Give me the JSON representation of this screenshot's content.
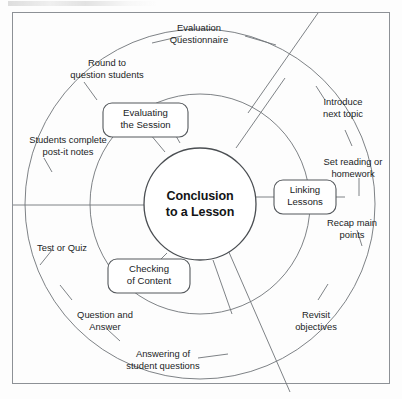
{
  "figure": {
    "hub": {
      "line1": "Conclusion",
      "line2": "to a Lesson"
    },
    "nodes": [
      {
        "id": "evaluating-the-session",
        "line1": "Evaluating",
        "line2": "the Session"
      },
      {
        "id": "linking-lessons",
        "line1": "Linking",
        "line2": "Lessons"
      },
      {
        "id": "checking-of-content",
        "line1": "Checking",
        "line2": "of Content"
      }
    ],
    "outer_labels": [
      {
        "id": "evaluation-questionnaire",
        "line1": "Evaluation",
        "line2": "Questionnaire"
      },
      {
        "id": "round-to-question-students",
        "line1": "Round to",
        "line2": "question students"
      },
      {
        "id": "students-complete-post-it",
        "line1": "Students complete",
        "line2": "post-it notes"
      },
      {
        "id": "test-or-quiz",
        "line1": "Test or Quiz",
        "line2": ""
      },
      {
        "id": "question-and-answer",
        "line1": "Question and",
        "line2": "Answer"
      },
      {
        "id": "answering-of-student-questions",
        "line1": "Answering of",
        "line2": "student questions"
      },
      {
        "id": "revisit-objectives",
        "line1": "Revisit",
        "line2": "objectives"
      },
      {
        "id": "recap-main-points",
        "line1": "Recap main",
        "line2": "points"
      },
      {
        "id": "set-reading-or-homework",
        "line1": "Set reading or",
        "line2": "homework"
      },
      {
        "id": "introduce-next-topic",
        "line1": "Introduce",
        "line2": "next topic"
      }
    ],
    "colors": {
      "background": "#fdfdfd",
      "frame_stroke": "#8d9196",
      "ring_stroke": "#6f7478",
      "hub_stroke": "#4a4e52",
      "node_stroke": "#55595d",
      "text": "#1a1c1e"
    }
  }
}
